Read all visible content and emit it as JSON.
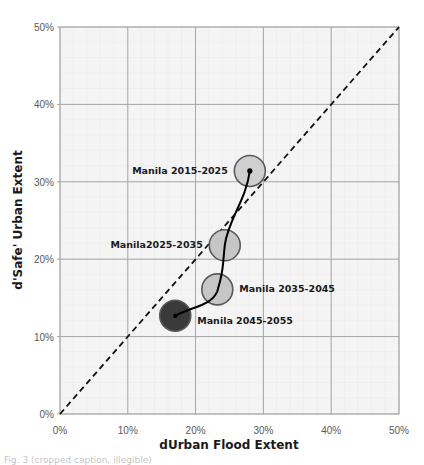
{
  "chart_data": {
    "type": "scatter",
    "subtype": "bubble-trajectory",
    "title": "",
    "xlabel": "dUrban Flood Extent",
    "ylabel": "d'Safe' Urban Extent",
    "xlim": [
      0,
      50
    ],
    "ylim": [
      0,
      50
    ],
    "x_ticks": [
      "0%",
      "10%",
      "20%",
      "30%",
      "40%",
      "50%"
    ],
    "y_ticks": [
      "0%",
      "10%",
      "20%",
      "30%",
      "40%",
      "50%"
    ],
    "grid": true,
    "minor_grid": true,
    "legend": "none",
    "reference_line": {
      "type": "y=x",
      "style": "dashed",
      "color": "#111111"
    },
    "points": [
      {
        "label": "Manila 2015-2025",
        "x": 28.0,
        "y": 31.4,
        "fill": "#cfcfcf",
        "label_side": "left"
      },
      {
        "label": "Manila2025-2035",
        "x": 24.3,
        "y": 21.8,
        "fill": "#c6c6c6",
        "label_side": "left"
      },
      {
        "label": "Manila 2035-2045",
        "x": 23.2,
        "y": 16.1,
        "fill": "#c6c6c6",
        "label_side": "right"
      },
      {
        "label": "Manila 2045-2055",
        "x": 17.0,
        "y": 12.7,
        "fill": "#3a3a3a",
        "label_side": "right"
      }
    ],
    "trajectory": {
      "from": "Manila 2015-2025",
      "to": "Manila 2045-2055",
      "style": "solid curve",
      "color": "#000000"
    }
  },
  "caption": "Fig. 3 (cropped caption, illegible)"
}
